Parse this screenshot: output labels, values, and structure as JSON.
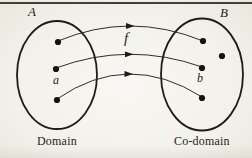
{
  "figure": {
    "left_set": {
      "label": "A",
      "caption": "Domain",
      "element_label": "a",
      "points": 3
    },
    "right_set": {
      "label": "B",
      "caption": "Co-domain",
      "element_label": "b",
      "points": 4
    },
    "function_label": "f",
    "mapping_arrows": 3,
    "colors": {
      "ink": "#1d1c1a",
      "arrow": "#2f2d2a",
      "background": "#f3f1ea",
      "top_rule": "#413f3c"
    }
  }
}
